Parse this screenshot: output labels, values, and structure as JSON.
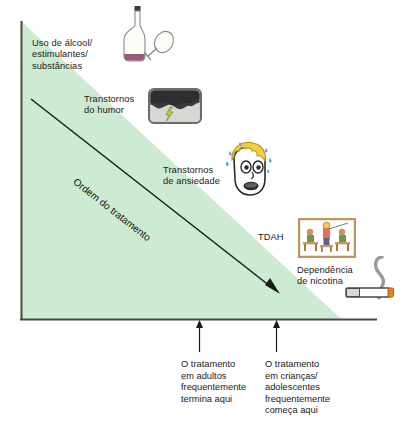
{
  "figure": {
    "type": "diagram",
    "subtype": "treatment-order-triangle",
    "language": "pt-BR",
    "colors": {
      "triangle_fill": "#cdebd2",
      "axis": "#4a4a4a",
      "arrow": "#1a1a1a",
      "text": "#1a1a1a",
      "hair_yellow": "#f5cf3d",
      "skin": "#ffffff",
      "sweat_blue": "#5aa9e6",
      "cloud_dark": "#3a3a3a",
      "cloud_light": "#cfcfcf",
      "bolt_green": "#bcd44a",
      "frame_tan": "#b99a5e",
      "wine_purple": "#8c3b63",
      "cigarette_body": "#ffffff",
      "ember_orange": "#e8811f",
      "smoke_grey": "#9a9a9a"
    },
    "diagonal_axis_label": "Ordem do tratamento",
    "conditions": [
      {
        "id": "alcohol",
        "label": "Uso de álcool/\nestimulantes/\nsubstâncias",
        "icon": "wine-bottle-and-glass-icon",
        "order": 1
      },
      {
        "id": "mood",
        "label": "Transtornos\ndo humor",
        "icon": "storm-cloud-lightning-icon",
        "order": 2
      },
      {
        "id": "anxiety",
        "label": "Transtornos\nde ansiedade",
        "icon": "anxious-face-icon",
        "order": 3
      },
      {
        "id": "adhd",
        "label": "TDAH",
        "icon": "classroom-icon",
        "order": 4
      },
      {
        "id": "nicotine",
        "label": "Dependência\nde nicotina",
        "icon": "cigarette-icon",
        "order": 5
      }
    ],
    "markers": [
      {
        "id": "adults-end",
        "label": "O tratamento\nem adultos\nfrequentemente\ntermina aqui",
        "x_position": 199
      },
      {
        "id": "children-start",
        "label": "O tratamento\nem crianças/\nadolescentes\nfrequentemente\ncomeça aqui",
        "x_position": 276
      }
    ],
    "bottom_cut_text": " "
  }
}
